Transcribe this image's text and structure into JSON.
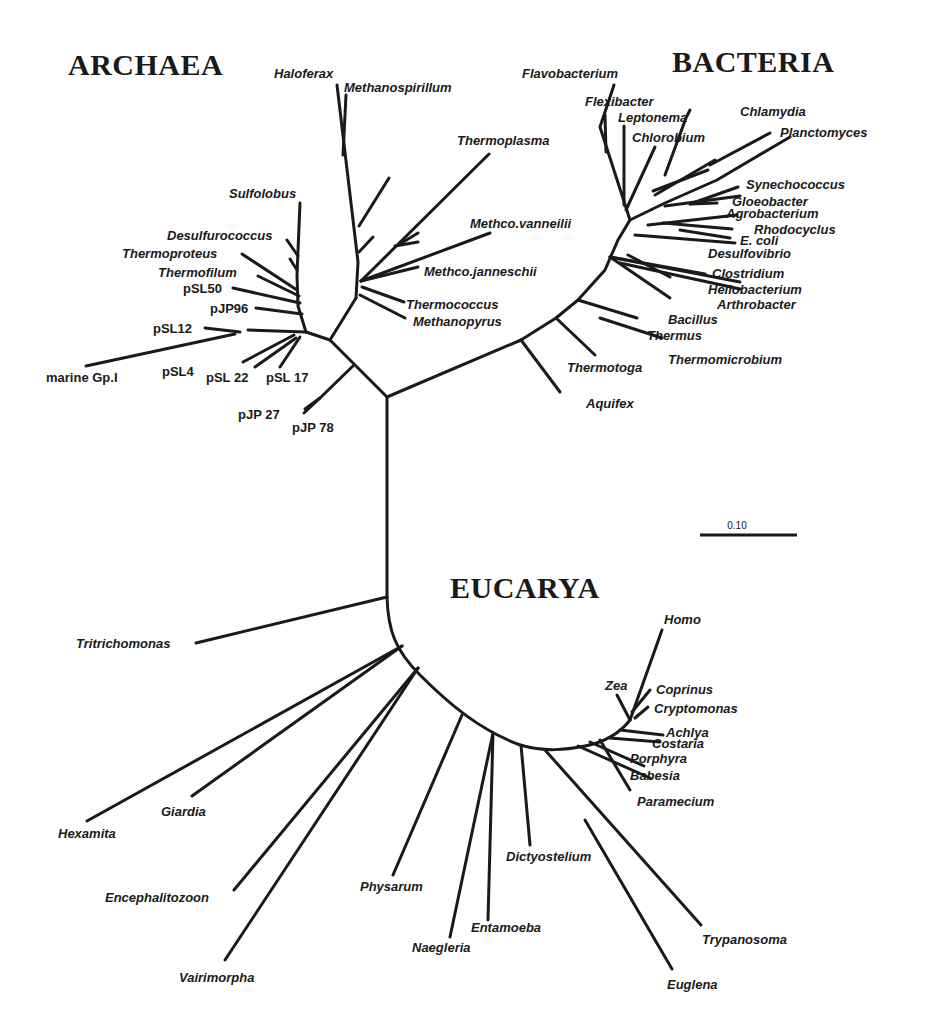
{
  "domains": {
    "archaea": "ARCHAEA",
    "bacteria": "BACTERIA",
    "eucarya": "EUCARYA"
  },
  "scale_bar": {
    "label": "0.10"
  },
  "archaea": {
    "haloferax": "Haloferax",
    "methanospirillum": "Methanospirillum",
    "thermoplasma": "Thermoplasma",
    "sulfolobus": "Sulfolobus",
    "methco_vanneilii": "Methco.vanneilii",
    "desulfurococcus": "Desulfurococcus",
    "thermoproteus": "Thermoproteus",
    "methco_janneschii": "Methco.janneschii",
    "thermofilum": "Thermofilum",
    "psl50": "pSL50",
    "thermococcus": "Thermococcus",
    "pjp96": "pJP96",
    "methanopyrus": "Methanopyrus",
    "psl12": "pSL12",
    "marine_gp1": "marine Gp.I",
    "psl4": "pSL4",
    "psl22": "pSL 22",
    "psl17": "pSL 17",
    "pjp27": "pJP 27",
    "pjp78": "pJP 78"
  },
  "bacteria": {
    "flavobacterium": "Flavobacterium",
    "flexibacter": "Flexibacter",
    "leptonema": "Leptonema",
    "chlorobium": "Chlorobium",
    "chlamydia": "Chlamydia",
    "planctomyces": "Planctomyces",
    "synechococcus": "Synechococcus",
    "gloeobacter": "Gloeobacter",
    "agrobacterium": "Agrobacterium",
    "rhodocyclus": "Rhodocyclus",
    "ecoli": "E. coli",
    "desulfovibrio": "Desulfovibrio",
    "clostridium": "Clostridium",
    "heliobacterium": "Heliobacterium",
    "arthrobacter": "Arthrobacter",
    "bacillus": "Bacillus",
    "thermus": "Thermus",
    "thermomicrobium": "Thermomicrobium",
    "thermotoga": "Thermotoga",
    "aquifex": "Aquifex"
  },
  "eucarya": {
    "homo": "Homo",
    "zea": "Zea",
    "coprinus": "Coprinus",
    "cryptomonas": "Cryptomonas",
    "achlya": "Achlya",
    "costaria": "Costaria",
    "porphyra": "Porphyra",
    "babesia": "Babesia",
    "paramecium": "Paramecium",
    "tritrichomonas": "Tritrichomonas",
    "giardia": "Giardia",
    "hexamita": "Hexamita",
    "encephalitozoon": "Encephalitozoon",
    "vairimorpha": "Vairimorpha",
    "physarum": "Physarum",
    "naegleria": "Naegleria",
    "entamoeba": "Entamoeba",
    "dictyostelium": "Dictyostelium",
    "trypanosoma": "Trypanosoma",
    "euglena": "Euglena"
  }
}
